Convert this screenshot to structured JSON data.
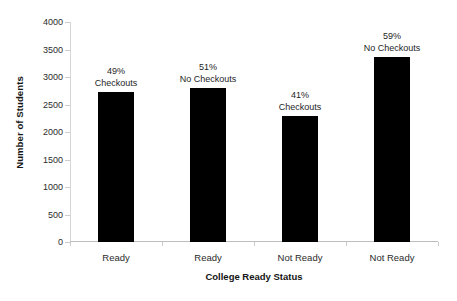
{
  "chart_data": {
    "type": "bar",
    "title": "",
    "xlabel": "College Ready Status",
    "ylabel": "Number of Students",
    "categories": [
      "Ready",
      "Ready",
      "Not Ready",
      "Not Ready"
    ],
    "values": [
      2727,
      2800,
      2290,
      3364
    ],
    "point_labels": [
      {
        "percent": "49%",
        "category": "Checkouts"
      },
      {
        "percent": "51%",
        "category": "No Checkouts"
      },
      {
        "percent": "41%",
        "category": "Checkouts"
      },
      {
        "percent": "59%",
        "category": "No Checkouts"
      }
    ],
    "ylim": [
      0,
      4000
    ],
    "yticks": [
      0,
      500,
      1000,
      1500,
      2000,
      2500,
      3000,
      3500,
      4000
    ],
    "ytick_labels": [
      "0",
      "500",
      "1000",
      "1500",
      "2000",
      "2500",
      "3000",
      "3500",
      "4000"
    ],
    "grid": false,
    "legend": false,
    "bar_color": "#000000",
    "axis_color": "#cccccc",
    "background": "#ffffff"
  }
}
